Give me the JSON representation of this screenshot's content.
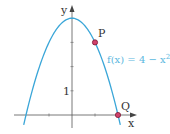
{
  "chart_data": {
    "type": "line",
    "title": "",
    "xlabel": "x",
    "ylabel": "y",
    "xlim": [
      -2.4,
      2.9
    ],
    "ylim": [
      -0.5,
      4.6
    ],
    "x_ticks": [
      -1,
      1
    ],
    "y_ticks": [
      1,
      2,
      3
    ],
    "y_tick_labels": [
      {
        "value": 1,
        "label": "1"
      }
    ],
    "grid": false,
    "series": [
      {
        "name": "f(x) = 4 − x²",
        "expression": "4 - x^2",
        "color": "#3aa6d8",
        "x_range": [
          -2.1,
          2.1
        ]
      }
    ],
    "points": [
      {
        "label": "P",
        "x": 1,
        "y": 3
      },
      {
        "label": "Q",
        "x": 2,
        "y": 0
      }
    ],
    "annotations": [
      {
        "text": "f(x) = 4 − x",
        "superscript": "2",
        "near": "right of curve"
      }
    ]
  }
}
